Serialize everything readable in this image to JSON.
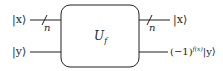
{
  "diagram": {
    "type": "quantum-circuit",
    "gate": {
      "label": "U",
      "subscript": "f"
    },
    "inputs": [
      {
        "label": "|x⟩",
        "register_size": "n"
      },
      {
        "label": "|y⟩"
      }
    ],
    "outputs": [
      {
        "label": "|x⟩",
        "register_size": "n"
      },
      {
        "prefix": "(−1)",
        "superscript": "f(x)",
        "label": "|y⟩"
      }
    ],
    "colors": {
      "stroke": "#231f20",
      "background": "#ffffff"
    }
  }
}
